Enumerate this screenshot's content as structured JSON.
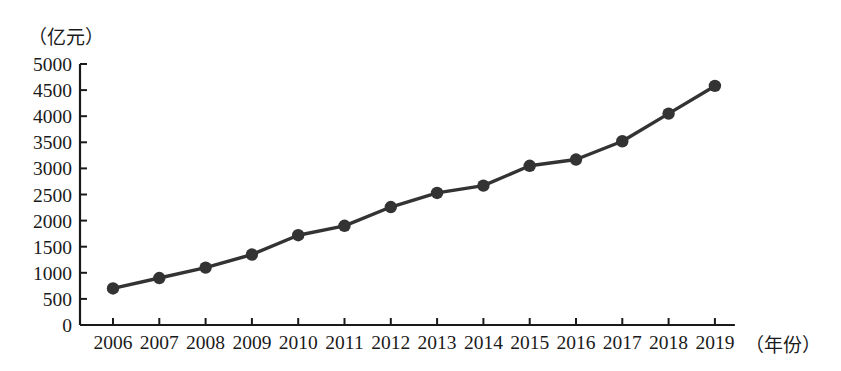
{
  "chart_data": {
    "type": "line",
    "title": "",
    "xlabel": "（年份）",
    "ylabel": "（亿元）",
    "categories": [
      "2006",
      "2007",
      "2008",
      "2009",
      "2010",
      "2011",
      "2012",
      "2013",
      "2014",
      "2015",
      "2016",
      "2017",
      "2018",
      "2019"
    ],
    "values": [
      700,
      900,
      1100,
      1350,
      1720,
      1900,
      2260,
      2530,
      2670,
      3050,
      3170,
      3520,
      4050,
      4580
    ],
    "series": [
      {
        "name": "",
        "values": [
          700,
          900,
          1100,
          1350,
          1720,
          1900,
          2260,
          2530,
          2670,
          3050,
          3170,
          3520,
          4050,
          4580
        ]
      }
    ],
    "ylim": [
      0,
      5000
    ],
    "yticks": [
      0,
      500,
      1000,
      1500,
      2000,
      2500,
      3000,
      3500,
      4000,
      4500,
      5000
    ],
    "ytick_labels": [
      "0",
      "500",
      "1000",
      "1500",
      "2000",
      "2500",
      "3000",
      "3500",
      "4000",
      "4500",
      "5000"
    ],
    "xtick_labels": [
      "2006",
      "2007",
      "2008",
      "2009",
      "2010",
      "2011",
      "2012",
      "2013",
      "2014",
      "2015",
      "2016",
      "2017",
      "2018",
      "2019"
    ],
    "grid": false,
    "legend": "none",
    "marker": "filled-circle",
    "line_color": "#333333",
    "marker_color": "#333333",
    "axis_color": "#1a1a1a",
    "background_color": "#ffffff"
  },
  "labels": {
    "y_unit": "（亿元）",
    "x_unit": "（年份）"
  }
}
